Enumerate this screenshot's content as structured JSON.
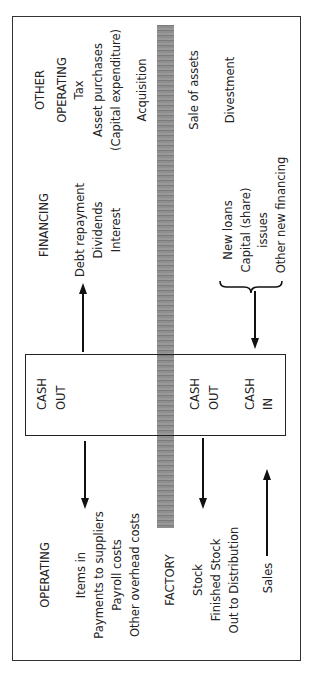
{
  "diagram": {
    "colors": {
      "line": "#111111",
      "bar": "#8a8a8a",
      "background": "#ffffff"
    },
    "sections": {
      "other_operating": {
        "heading": [
          "OTHER",
          "OPERATING"
        ],
        "out_items": [
          "Tax",
          "Asset purchases",
          "(Capital expenditure)",
          "Acquisition"
        ],
        "in_items": [
          "Sale of assets",
          "Divestment"
        ]
      },
      "financing": {
        "heading": "FINANCING",
        "out_items": [
          "Debt repayment",
          "Dividends",
          "Interest"
        ],
        "in_items": [
          "New loans",
          "Capital (share)",
          "issues",
          "Other new financing"
        ]
      },
      "cash_box": {
        "left": [
          "CASH",
          "OUT"
        ],
        "middle": [
          "CASH",
          "OUT"
        ],
        "right": [
          "CASH",
          "IN"
        ]
      },
      "operating": {
        "heading": "OPERATING",
        "items": [
          "Items in",
          "Payments to suppliers",
          "Payroll costs",
          "Other overhead costs"
        ]
      },
      "factory": {
        "heading": "FACTORY",
        "items": [
          "Stock",
          "Finished Stock",
          "Out to Distribution"
        ]
      },
      "sales": {
        "label": "Sales"
      }
    }
  }
}
